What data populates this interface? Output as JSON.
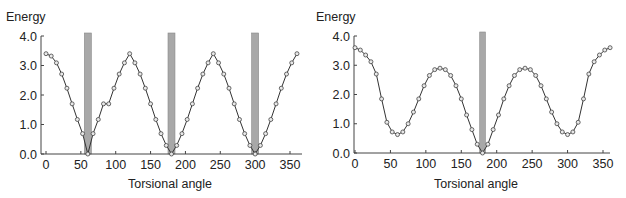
{
  "chart_data": [
    {
      "type": "line",
      "title": "",
      "ylabel": "Energy",
      "xlabel": "Torsional angle",
      "xlim": [
        0,
        360
      ],
      "ylim": [
        0,
        4.0
      ],
      "xticks": [
        0,
        50,
        100,
        150,
        200,
        250,
        300,
        350
      ],
      "yticks": [
        "0.0",
        "1.0",
        "2.0",
        "3.0",
        "4.0"
      ],
      "grid": false,
      "model": {
        "form": "A*(1+cos(3x))",
        "A": 1.7
      },
      "highlight_bands": [
        [
          55,
          65
        ],
        [
          175,
          185
        ],
        [
          295,
          305
        ]
      ],
      "series": [
        {
          "name": "energy",
          "x_step": 7.5,
          "x": [
            0,
            7.5,
            15,
            22.5,
            30,
            37.5,
            45,
            52.5,
            60,
            67.5,
            75,
            82.5,
            90,
            97.5,
            105,
            112.5,
            120,
            127.5,
            135,
            142.5,
            150,
            157.5,
            165,
            172.5,
            180,
            187.5,
            195,
            202.5,
            210,
            217.5,
            225,
            232.5,
            240,
            247.5,
            255,
            262.5,
            270,
            277.5,
            285,
            292.5,
            300,
            307.5,
            315,
            322.5,
            330,
            337.5,
            345,
            352.5,
            360
          ],
          "y": [
            3.4,
            3.32,
            3.09,
            2.71,
            2.23,
            1.7,
            1.17,
            0.69,
            0.0,
            0.69,
            1.17,
            1.7,
            1.7,
            2.23,
            2.71,
            3.09,
            3.4,
            3.09,
            2.71,
            2.23,
            1.7,
            1.17,
            0.69,
            0.29,
            0.0,
            0.29,
            0.69,
            1.17,
            1.7,
            2.23,
            2.71,
            3.09,
            3.4,
            3.09,
            2.71,
            2.23,
            1.7,
            1.17,
            0.69,
            0.29,
            0.0,
            0.29,
            0.69,
            1.17,
            1.7,
            2.23,
            2.71,
            3.09,
            3.4
          ]
        }
      ]
    },
    {
      "type": "line",
      "title": "",
      "ylabel": "Energy",
      "xlabel": "Torsional angle",
      "xlim": [
        0,
        360
      ],
      "ylim": [
        0,
        4.0
      ],
      "xticks": [
        0,
        50,
        100,
        150,
        200,
        250,
        300,
        350
      ],
      "yticks": [
        "0.0",
        "1.0",
        "2.0",
        "3.0",
        "4.0"
      ],
      "grid": false,
      "highlight_bands": [
        [
          176,
          184
        ]
      ],
      "series": [
        {
          "name": "energy",
          "x": [
            0,
            7.5,
            15,
            22.5,
            30,
            37.5,
            45,
            52.5,
            60,
            67.5,
            75,
            82.5,
            90,
            97.5,
            105,
            112.5,
            120,
            127.5,
            135,
            142.5,
            150,
            157.5,
            165,
            172.5,
            180,
            187.5,
            195,
            202.5,
            210,
            217.5,
            225,
            232.5,
            240,
            247.5,
            255,
            262.5,
            270,
            277.5,
            285,
            292.5,
            300,
            307.5,
            315,
            322.5,
            330,
            337.5,
            345,
            352.5,
            360
          ],
          "y": [
            3.6,
            3.52,
            3.35,
            3.12,
            2.7,
            1.85,
            1.05,
            0.72,
            0.63,
            0.72,
            1.0,
            1.4,
            1.85,
            2.3,
            2.65,
            2.85,
            2.9,
            2.85,
            2.65,
            2.3,
            1.85,
            1.3,
            0.8,
            0.3,
            0.0,
            0.3,
            0.8,
            1.3,
            1.85,
            2.3,
            2.65,
            2.85,
            2.9,
            2.85,
            2.65,
            2.3,
            1.85,
            1.4,
            1.0,
            0.72,
            0.63,
            0.72,
            1.05,
            1.85,
            2.7,
            3.12,
            3.35,
            3.52,
            3.6
          ]
        }
      ]
    }
  ]
}
